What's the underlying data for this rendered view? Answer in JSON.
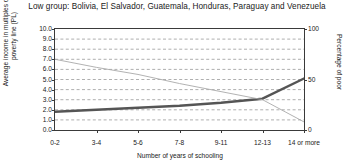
{
  "chart_data": {
    "type": "line",
    "title": "Low group: Bolivia, El Salvador, Guatemala, Honduras, Paraguay and Venezuela",
    "xlabel": "Number of years of schooling",
    "ylabel": "Average income in multiples of the poverty line (PL)",
    "ylabel_right": "Percentage of poor",
    "categories": [
      "0-2",
      "3-4",
      "5-6",
      "7-8",
      "9-11",
      "12-13",
      "14 or more"
    ],
    "ylim": [
      0,
      10
    ],
    "yticks": [
      "0.0",
      "1.0",
      "2.0",
      "3.0",
      "4.0",
      "5.0",
      "6.0",
      "7.0",
      "8.0",
      "9.0",
      "10.0"
    ],
    "ylim_right": [
      0,
      100
    ],
    "yticks_right": [
      "0",
      "50",
      "100"
    ],
    "grid": true,
    "legend": "none",
    "series": [
      {
        "name": "Average income in multiples of the poverty line (PL)",
        "axis": "left",
        "color": "#555555",
        "values": [
          1.8,
          2.0,
          2.2,
          2.4,
          2.7,
          3.1,
          5.1
        ]
      },
      {
        "name": "Percentage of poor",
        "axis": "right",
        "color": "#a9a9a9",
        "values": [
          70,
          62,
          55,
          46,
          38,
          30,
          8
        ]
      }
    ]
  }
}
